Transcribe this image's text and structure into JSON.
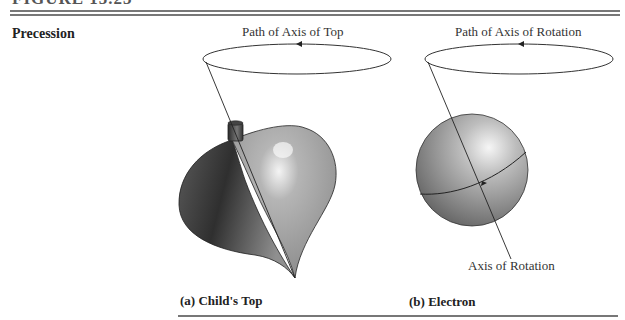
{
  "figure": {
    "title": "FIGURE 15.23",
    "side_label": "Precession"
  },
  "panels": [
    {
      "id": "a",
      "path_label": "Path of Axis of Top",
      "caption": "(a) Child's Top",
      "object": "spinning-top"
    },
    {
      "id": "b",
      "path_label": "Path of Axis of Rotation",
      "axis_label": "Axis of Rotation",
      "caption": "(b) Electron",
      "object": "sphere"
    }
  ],
  "colors": {
    "rule": "#777777",
    "line": "#333333",
    "shape_dark": "#3a3a3a",
    "shape_light": "#d8d8d8"
  }
}
